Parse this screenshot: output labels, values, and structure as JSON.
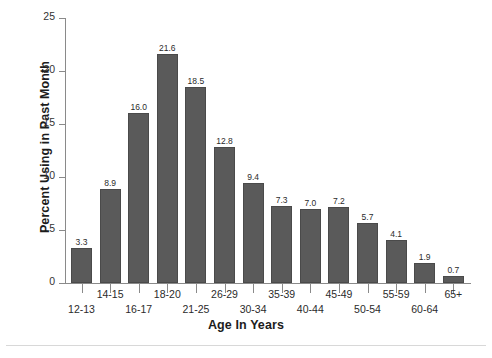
{
  "chart_data": {
    "type": "bar",
    "title": "",
    "xlabel": "Age In Years",
    "ylabel": "Percent Using in Past Month",
    "categories": [
      "12-13",
      "14-15",
      "16-17",
      "18-20",
      "21-25",
      "26-29",
      "30-34",
      "35-39",
      "40-44",
      "45-49",
      "50-54",
      "55-59",
      "60-64",
      "65+"
    ],
    "values": [
      3.3,
      8.9,
      16.0,
      21.6,
      18.5,
      12.8,
      9.4,
      7.3,
      7.0,
      7.2,
      5.7,
      4.1,
      1.9,
      0.7
    ],
    "value_labels": [
      "3.3",
      "8.9",
      "16.0",
      "21.6",
      "18.5",
      "12.8",
      "9.4",
      "7.3",
      "7.0",
      "7.2",
      "5.7",
      "4.1",
      "1.9",
      "0.7"
    ],
    "ylim": [
      0,
      25
    ],
    "yticks": [
      0,
      5,
      10,
      15,
      20,
      25
    ],
    "ytick_labels": [
      "0",
      "5",
      "10",
      "15",
      "20",
      "25"
    ],
    "grid": false,
    "legend": false,
    "bar_color": "#5a5a5a",
    "axis_color": "#8a8a8a",
    "text_color": "#2b2b2b",
    "xlabel_layout": "staggered-two-rows"
  }
}
